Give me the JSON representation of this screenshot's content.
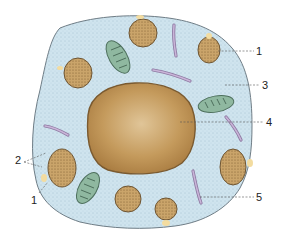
{
  "diagram": {
    "type": "cell-cross-section",
    "colors": {
      "cytoplasm": "#cfe4ee",
      "cytoplasm_dots": "#7fa3b8",
      "membrane": "#6f7d86",
      "nucleus": "#c49a5c",
      "nucleus_edge": "#7a5a30",
      "granule": "#c9a468",
      "granule_edge": "#6e5533",
      "mitochondrion": "#8fb8a0",
      "mitochondrion_edge": "#4d6f5c",
      "rod": "#b9a6c8",
      "fusion_pore": "#f3dca0"
    },
    "labels": [
      {
        "id": "1a",
        "text": "1"
      },
      {
        "id": "3",
        "text": "3"
      },
      {
        "id": "4",
        "text": "4"
      },
      {
        "id": "2",
        "text": "2"
      },
      {
        "id": "1b",
        "text": "1"
      },
      {
        "id": "5",
        "text": "5"
      }
    ]
  }
}
